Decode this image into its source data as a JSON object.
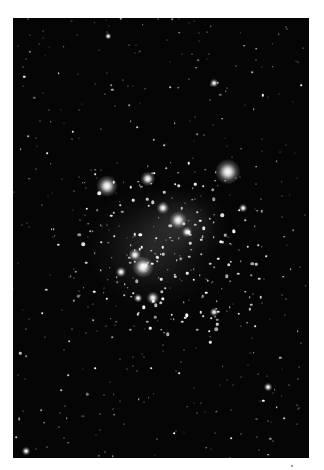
{
  "image": {
    "subject": "open star cluster (starfield photograph)",
    "background_color": "#050505",
    "frame": {
      "left": 13,
      "top": 18,
      "width": 296,
      "height": 440
    },
    "bright_stars": [
      {
        "x": 94,
        "y": 168,
        "r": 10
      },
      {
        "x": 215,
        "y": 154,
        "r": 12
      },
      {
        "x": 135,
        "y": 161,
        "r": 7
      },
      {
        "x": 165,
        "y": 202,
        "r": 8
      },
      {
        "x": 150,
        "y": 190,
        "r": 6
      },
      {
        "x": 130,
        "y": 249,
        "r": 10
      },
      {
        "x": 122,
        "y": 237,
        "r": 6
      },
      {
        "x": 140,
        "y": 280,
        "r": 6
      },
      {
        "x": 108,
        "y": 254,
        "r": 5
      },
      {
        "x": 174,
        "y": 214,
        "r": 5
      },
      {
        "x": 230,
        "y": 190,
        "r": 4
      },
      {
        "x": 125,
        "y": 280,
        "r": 4
      },
      {
        "x": 201,
        "y": 294,
        "r": 4
      },
      {
        "x": 255,
        "y": 369,
        "r": 4
      },
      {
        "x": 13,
        "y": 433,
        "r": 4
      },
      {
        "x": 201,
        "y": 65,
        "r": 4
      },
      {
        "x": 95,
        "y": 18,
        "r": 3
      }
    ],
    "haze": [
      {
        "x": 140,
        "y": 230,
        "w": 130,
        "h": 120
      },
      {
        "x": 170,
        "y": 205,
        "w": 90,
        "h": 70
      }
    ],
    "random_star_count": 420,
    "cluster_star_count": 180,
    "cluster_center": {
      "x": 160,
      "y": 235
    },
    "seed": 7
  },
  "corner_mark": {
    "x": 291,
    "y": 465
  }
}
